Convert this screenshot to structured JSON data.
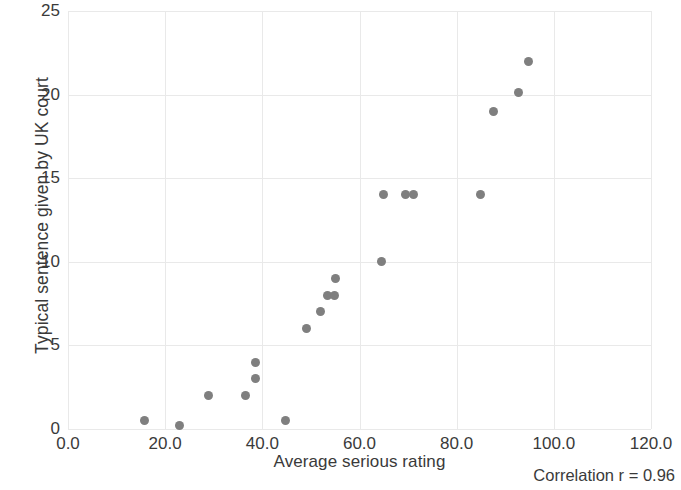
{
  "chart_data": {
    "type": "scatter",
    "title": "",
    "xlabel": "Average serious rating",
    "ylabel": "Typical sentence given by UK court",
    "xlim": [
      0,
      120
    ],
    "ylim": [
      0,
      25
    ],
    "xticks": [
      "0.0",
      "20.0",
      "40.0",
      "60.0",
      "80.0",
      "100.0",
      "120.0"
    ],
    "xtick_values": [
      0,
      20,
      40,
      60,
      80,
      100,
      120
    ],
    "yticks": [
      "0",
      "5",
      "10",
      "15",
      "20",
      "25"
    ],
    "ytick_values": [
      0,
      5,
      10,
      15,
      20,
      25
    ],
    "grid": true,
    "legend": "none",
    "marker_color": "#7f7f7f",
    "annotation": "Correlation r = 0.96",
    "correlation_r": 0.96,
    "points": [
      {
        "x": 15.7,
        "y": 0.5
      },
      {
        "x": 23.0,
        "y": 0.2
      },
      {
        "x": 29.0,
        "y": 2.0
      },
      {
        "x": 36.5,
        "y": 2.0
      },
      {
        "x": 38.5,
        "y": 3.0
      },
      {
        "x": 38.6,
        "y": 4.0
      },
      {
        "x": 44.7,
        "y": 0.5
      },
      {
        "x": 49.0,
        "y": 6.0
      },
      {
        "x": 52.0,
        "y": 7.0
      },
      {
        "x": 53.5,
        "y": 8.0
      },
      {
        "x": 54.8,
        "y": 8.0
      },
      {
        "x": 55.0,
        "y": 9.0
      },
      {
        "x": 64.6,
        "y": 10.0
      },
      {
        "x": 65.0,
        "y": 14.0
      },
      {
        "x": 69.4,
        "y": 14.0
      },
      {
        "x": 71.2,
        "y": 14.0
      },
      {
        "x": 85.0,
        "y": 14.0
      },
      {
        "x": 87.5,
        "y": 19.0
      },
      {
        "x": 92.8,
        "y": 20.1
      },
      {
        "x": 94.7,
        "y": 22.0
      }
    ]
  }
}
